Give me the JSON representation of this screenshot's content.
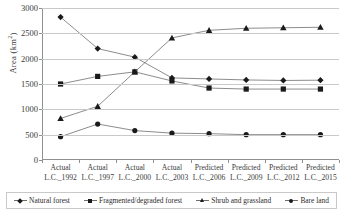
{
  "chart_data": {
    "type": "line",
    "title": "",
    "xlabel": "",
    "ylabel": "Area (km²)",
    "ylabel_main": "Area (km",
    "ylabel_sup": "2",
    "ylabel_tail": ")",
    "ylim": [
      0,
      3000
    ],
    "ytick_step": 500,
    "grid": true,
    "legend_position": "bottom",
    "categories": [
      "Actual L.C._1992",
      "Actual L.C._1997",
      "Actual L.C._2000",
      "Actual L.C._2003",
      "Predicted L.C._2006",
      "Predicted L.C._2009",
      "Predicted L.C._2012",
      "Predicted L.C._2015"
    ],
    "category_lines": [
      [
        "Actual",
        "L.C._1992"
      ],
      [
        "Actual",
        "L.C._1997"
      ],
      [
        "Actual",
        "L.C._2000"
      ],
      [
        "Actual",
        "L.C._2003"
      ],
      [
        "Predicted",
        "L.C._2006"
      ],
      [
        "Predicted",
        "L.C._2009"
      ],
      [
        "Predicted",
        "L.C._2012"
      ],
      [
        "Predicted",
        "L.C._2015"
      ]
    ],
    "yticks": [
      0,
      500,
      1000,
      1500,
      2000,
      2500,
      3000
    ],
    "series": [
      {
        "name": "Natural forest",
        "marker": "diamond",
        "color": "#1a1a1a",
        "values": [
          2820,
          2200,
          2030,
          1620,
          1600,
          1580,
          1570,
          1575
        ]
      },
      {
        "name": "Fragmented/degraded forest",
        "marker": "square",
        "color": "#1a1a1a",
        "values": [
          1500,
          1650,
          1740,
          1560,
          1420,
          1400,
          1400,
          1400
        ]
      },
      {
        "name": "Shrub and grassland",
        "marker": "triangle",
        "color": "#1a1a1a",
        "values": [
          820,
          1060,
          1740,
          2410,
          2560,
          2600,
          2610,
          2620
        ]
      },
      {
        "name": "Bare land",
        "marker": "circle",
        "color": "#1a1a1a",
        "values": [
          460,
          710,
          580,
          530,
          520,
          500,
          500,
          500
        ]
      }
    ]
  },
  "legend": {
    "items": [
      {
        "label": "Natural forest",
        "marker": "diamond"
      },
      {
        "label": "Fragmented/degraded forest",
        "marker": "square"
      },
      {
        "label": "Shrub and grassland",
        "marker": "triangle"
      },
      {
        "label": "Bare land",
        "marker": "circle"
      }
    ]
  },
  "colors": {
    "gridline": "#c9c9c9",
    "axis": "#8f8f8f",
    "line": "#6e6e6e",
    "marker": "#1a1a1a",
    "text": "#2b2b2b",
    "background": "#ffffff"
  }
}
